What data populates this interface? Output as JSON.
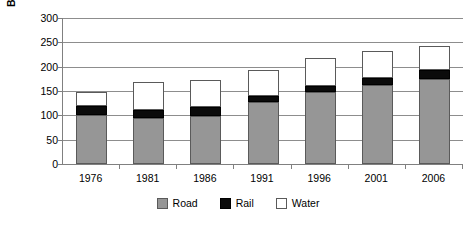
{
  "chart_data": {
    "type": "bar",
    "subtype": "stacked-vertical",
    "title": "",
    "xlabel": "",
    "ylabel": "Billion tonne-kms",
    "categories": [
      "1976",
      "1981",
      "1986",
      "1991",
      "1996",
      "2001",
      "2006"
    ],
    "series": [
      {
        "name": "Road",
        "color": "#969696",
        "values": [
          100,
          94,
          98,
          127,
          148,
          162,
          175
        ]
      },
      {
        "name": "Rail",
        "color": "#0b0b0b",
        "values": [
          19,
          17,
          19,
          13,
          12,
          15,
          19
        ]
      },
      {
        "name": "Water",
        "color": "#ffffff",
        "values": [
          30,
          57,
          55,
          53,
          58,
          55,
          49
        ]
      }
    ],
    "totals": [
      149,
      168,
      172,
      193,
      218,
      232,
      243
    ],
    "ylim": [
      0,
      300
    ],
    "ytick_values": [
      0,
      50,
      100,
      150,
      200,
      250,
      300
    ],
    "ytick_labels": [
      "0",
      "50",
      "100",
      "150",
      "200",
      "250",
      "300"
    ],
    "grid": true,
    "grid_axis": "y",
    "legend_position": "bottom",
    "legend_entries": [
      "Road",
      "Rail",
      "Water"
    ]
  }
}
